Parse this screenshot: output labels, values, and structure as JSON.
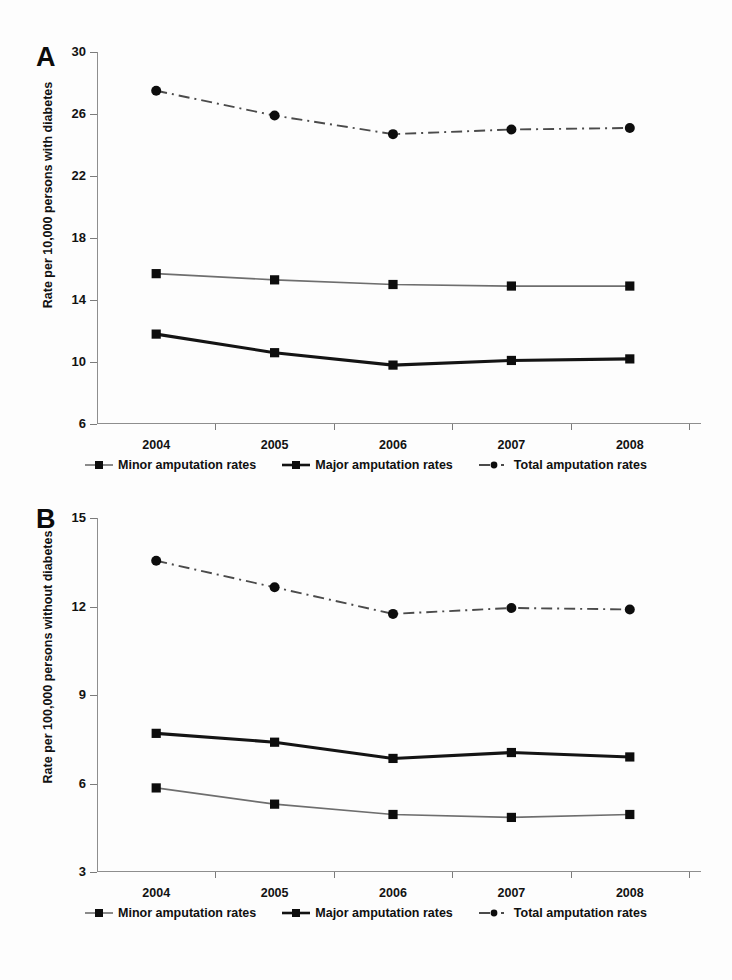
{
  "figure": {
    "panels": [
      {
        "letter": "A",
        "ylabel": "Rate per 10,000 persons with diabetes",
        "yticks": [
          "30",
          "26",
          "22",
          "18",
          "14",
          "10",
          "6"
        ],
        "xticks": [
          "2004",
          "2005",
          "2006",
          "2007",
          "2008"
        ],
        "legend": [
          {
            "label": "Minor amputation rates",
            "marker": "square-marker",
            "style": "thin-solid"
          },
          {
            "label": "Major amputation rates",
            "marker": "square-marker",
            "style": "thick-solid"
          },
          {
            "label": "Total amputation rates",
            "marker": "circle-marker",
            "style": "dash-dot"
          }
        ]
      },
      {
        "letter": "B",
        "ylabel": "Rate per 100,000 persons without diabetes",
        "yticks": [
          "15",
          "12",
          "9",
          "6",
          "3"
        ],
        "xticks": [
          "2004",
          "2005",
          "2006",
          "2007",
          "2008"
        ],
        "legend": [
          {
            "label": "Minor amputation rates",
            "marker": "square-marker",
            "style": "thin-solid"
          },
          {
            "label": "Major amputation rates",
            "marker": "square-marker",
            "style": "thick-solid"
          },
          {
            "label": "Total amputation rates",
            "marker": "circle-marker",
            "style": "dash-dot"
          }
        ]
      }
    ]
  },
  "chart_data": [
    {
      "type": "line",
      "panel": "A",
      "title": "",
      "xlabel": "",
      "ylabel": "Rate per 10,000 persons with diabetes",
      "categories": [
        "2004",
        "2005",
        "2006",
        "2007",
        "2008"
      ],
      "ylim": [
        6,
        30
      ],
      "ytick_values": [
        30,
        26,
        22,
        18,
        14,
        10,
        6
      ],
      "grid": false,
      "legend_position": "below",
      "series": [
        {
          "name": "Minor amputation rates",
          "values": [
            15.7,
            15.3,
            15.0,
            14.9,
            14.9
          ],
          "marker": "square",
          "line": "thin-solid",
          "color": "#6e6e6e"
        },
        {
          "name": "Major amputation rates",
          "values": [
            11.8,
            10.6,
            9.8,
            10.1,
            10.2
          ],
          "marker": "square",
          "line": "thick-solid",
          "color": "#141414"
        },
        {
          "name": "Total amputation rates",
          "values": [
            27.5,
            25.9,
            24.7,
            25.0,
            25.1
          ],
          "marker": "circle",
          "line": "dash-dot",
          "color": "#4b4b4b"
        }
      ]
    },
    {
      "type": "line",
      "panel": "B",
      "title": "",
      "xlabel": "",
      "ylabel": "Rate per 100,000 persons without diabetes",
      "categories": [
        "2004",
        "2005",
        "2006",
        "2007",
        "2008"
      ],
      "ylim": [
        3,
        15
      ],
      "ytick_values": [
        15,
        12,
        9,
        6,
        3
      ],
      "grid": false,
      "legend_position": "below",
      "series": [
        {
          "name": "Minor amputation rates",
          "values": [
            5.85,
            5.3,
            4.95,
            4.85,
            4.95
          ],
          "marker": "square",
          "line": "thin-solid",
          "color": "#6e6e6e"
        },
        {
          "name": "Major amputation rates",
          "values": [
            7.7,
            7.4,
            6.85,
            7.05,
            6.9
          ],
          "marker": "square",
          "line": "thick-solid",
          "color": "#141414"
        },
        {
          "name": "Total amputation rates",
          "values": [
            13.55,
            12.65,
            11.75,
            11.95,
            11.9
          ],
          "marker": "circle",
          "line": "dash-dot",
          "color": "#4b4b4b"
        }
      ]
    }
  ]
}
